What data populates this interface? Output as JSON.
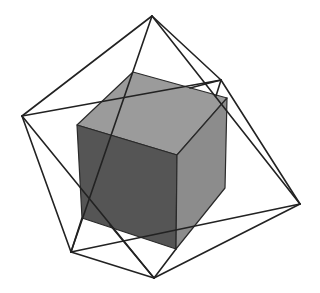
{
  "figure": {
    "width": 320,
    "height": 293,
    "background": "#ffffff"
  },
  "cube": {
    "faces": {
      "top": {
        "points": "133,72 227,98 177,155 77,125",
        "fill": "#9b9b9b"
      },
      "front": {
        "points": "77,125 177,155 176,249 82,218",
        "fill": "#555555"
      },
      "right": {
        "points": "177,155 227,98 225,188 176,249",
        "fill": "#8c8c8c"
      }
    },
    "edge_color": "#2a2a2a"
  },
  "octahedron": {
    "vertices": {
      "top": [
        152,
        16
      ],
      "left": [
        22,
        116
      ],
      "upper_right": [
        221,
        80
      ],
      "right": [
        300,
        204
      ],
      "bottom": [
        154,
        278
      ],
      "lower_left": [
        71,
        252
      ]
    },
    "edges": [
      [
        152,
        16,
        22,
        116
      ],
      [
        152,
        16,
        221,
        80
      ],
      [
        152,
        16,
        300,
        204
      ],
      [
        152,
        16,
        71,
        252
      ],
      [
        22,
        116,
        221,
        80
      ],
      [
        22,
        116,
        71,
        252
      ],
      [
        22,
        116,
        154,
        278
      ],
      [
        221,
        80,
        300,
        204
      ],
      [
        221,
        80,
        216,
        96
      ],
      [
        221,
        80,
        190,
        88
      ],
      [
        300,
        204,
        154,
        278
      ],
      [
        300,
        204,
        71,
        252
      ],
      [
        71,
        252,
        154,
        278
      ],
      [
        71,
        252,
        82,
        218
      ],
      [
        154,
        278,
        110,
        225
      ],
      [
        154,
        278,
        176,
        249
      ]
    ],
    "stroke": "#222222",
    "stroke_width": 1.6
  }
}
